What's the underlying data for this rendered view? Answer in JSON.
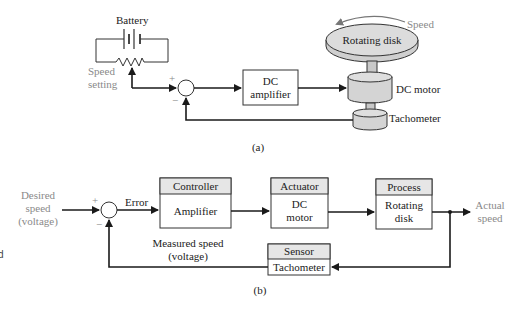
{
  "diagram_a": {
    "battery_label": "Battery",
    "speed_setting_line1": "Speed",
    "speed_setting_line2": "setting",
    "plus": "+",
    "minus": "−",
    "amplifier_line1": "DC",
    "amplifier_line2": "amplifier",
    "disk_label": "Rotating disk",
    "speed_label": "Speed",
    "motor_label": "DC motor",
    "tachometer_label": "Tachometer",
    "caption": "(a)"
  },
  "diagram_b": {
    "input_line1": "Desired",
    "input_line2": "speed",
    "input_line3": "(voltage)",
    "plus": "+",
    "minus": "−",
    "error_label": "Error",
    "controller": {
      "header": "Controller",
      "body": "Amplifier"
    },
    "actuator": {
      "header": "Actuator",
      "body_line1": "DC",
      "body_line2": "motor"
    },
    "process": {
      "header": "Process",
      "body_line1": "Rotating",
      "body_line2": "disk"
    },
    "output_line1": "Actual",
    "output_line2": "speed",
    "sensor": {
      "header": "Sensor",
      "body": "Tachometer"
    },
    "feedback_line1": "Measured speed",
    "feedback_line2": "(voltage)",
    "caption": "(b)"
  },
  "edge_fragment": "d",
  "colors": {
    "line": "#1a1a1a",
    "label_gray": "#8a8a8a",
    "header_fill": "#e6e6e6",
    "disk_fill": "#d9d9d9"
  }
}
